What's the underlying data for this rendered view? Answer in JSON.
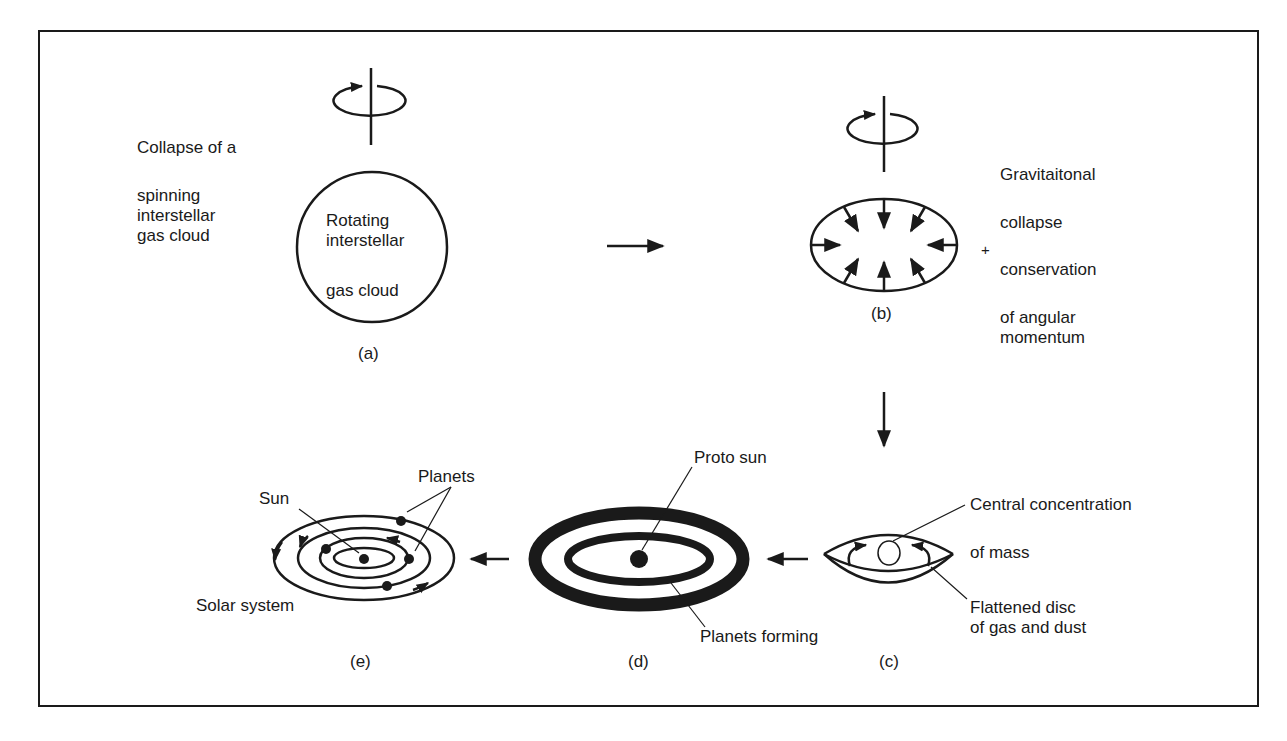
{
  "stages": {
    "a": {
      "caption": "(a)",
      "side_text_line1": "Collapse of a",
      "side_text_line2": "spinning",
      "side_text_line3": "interstellar",
      "side_text_line4": "gas cloud",
      "inner_line1": "Rotating",
      "inner_line2": "interstellar",
      "inner_line3": "gas cloud"
    },
    "b": {
      "caption": "(b)",
      "plus": "+",
      "side_line1": "Gravitaitonal",
      "side_line2": "collapse",
      "side_line3": "conservation",
      "side_line4": "of angular",
      "side_line5": "momentum"
    },
    "c": {
      "caption": "(c)",
      "label_top_line1": "Central concentration",
      "label_top_line2": "of mass",
      "label_bottom_line1": "Flattened disc",
      "label_bottom_line2": "of gas and dust"
    },
    "d": {
      "caption": "(d)",
      "label_top": "Proto sun",
      "label_bottom": "Planets forming"
    },
    "e": {
      "caption": "(e)",
      "label_sun": "Sun",
      "label_planets": "Planets",
      "label_system": "Solar system"
    }
  },
  "flow": [
    "a",
    "b",
    "c",
    "d",
    "e"
  ],
  "colors": {
    "ink": "#1a1a1a",
    "background": "#ffffff"
  }
}
